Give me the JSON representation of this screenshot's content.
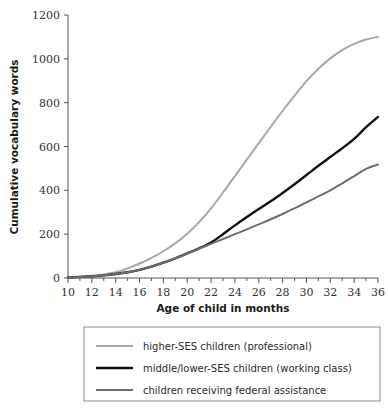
{
  "chart_data": {
    "type": "line",
    "title": "",
    "xlabel": "Age of child in months",
    "ylabel": "Cumulative vocabulary words",
    "xlim": [
      10,
      36
    ],
    "ylim": [
      0,
      1200
    ],
    "grid": false,
    "legend_position": "bottom",
    "x_ticks": [
      10,
      12,
      14,
      16,
      18,
      20,
      22,
      24,
      26,
      28,
      30,
      32,
      34,
      36
    ],
    "x_minor_ticks": [
      11,
      13,
      15,
      17,
      19,
      21,
      23,
      25,
      27,
      29,
      31,
      33,
      35
    ],
    "y_ticks": [
      0,
      200,
      400,
      600,
      800,
      1000,
      1200
    ],
    "x_tick_labels": [
      "10",
      "12",
      "14",
      "16",
      "18",
      "20",
      "22",
      "24",
      "26",
      "28",
      "30",
      "32",
      "34",
      "36"
    ],
    "y_tick_labels": [
      "0",
      "200",
      "400",
      "600",
      "800",
      "1000",
      "1200"
    ],
    "x": [
      10,
      11,
      12,
      13,
      14,
      15,
      16,
      17,
      18,
      19,
      20,
      21,
      22,
      23,
      24,
      25,
      26,
      27,
      28,
      29,
      30,
      31,
      32,
      33,
      34,
      35,
      36
    ],
    "series": [
      {
        "name": "higher-SES children (professional)",
        "color": "#a8a8a8",
        "width": 2.0,
        "values": [
          3,
          6,
          10,
          16,
          26,
          44,
          66,
          92,
          122,
          158,
          202,
          255,
          318,
          390,
          465,
          540,
          615,
          690,
          762,
          832,
          898,
          955,
          1002,
          1040,
          1068,
          1088,
          1100
        ]
      },
      {
        "name": "middle/lower-SES children (working class)",
        "color": "#111111",
        "width": 2.4,
        "values": [
          3,
          5,
          8,
          12,
          18,
          26,
          37,
          52,
          70,
          90,
          112,
          135,
          162,
          200,
          240,
          278,
          315,
          350,
          388,
          428,
          470,
          512,
          552,
          592,
          635,
          688,
          735
        ]
      },
      {
        "name": "children receiving federal assistance",
        "color": "#6e6e6e",
        "width": 2.0,
        "values": [
          3,
          5,
          8,
          12,
          18,
          26,
          37,
          52,
          70,
          90,
          112,
          134,
          156,
          178,
          200,
          222,
          245,
          268,
          292,
          318,
          345,
          372,
          400,
          432,
          465,
          498,
          518
        ]
      }
    ]
  },
  "legend": {
    "entries": [
      {
        "label": "higher-SES children (professional)",
        "color": "#a8a8a8"
      },
      {
        "label": "middle/lower-SES children (working class)",
        "color": "#111111"
      },
      {
        "label": "children receiving federal assistance",
        "color": "#6e6e6e"
      }
    ]
  }
}
